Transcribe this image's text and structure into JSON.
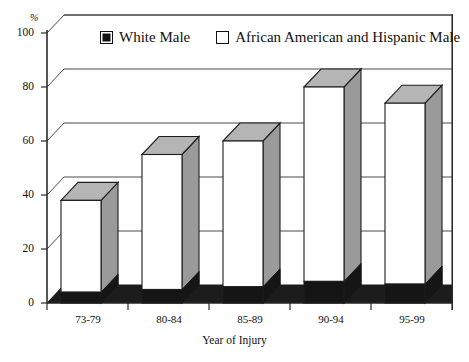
{
  "chart_data": {
    "type": "bar",
    "subtype": "stacked-3d-column",
    "title": "",
    "xlabel": "Year of Injury",
    "ylabel": "%",
    "ylim": [
      0,
      100
    ],
    "yticks": [
      0,
      20,
      40,
      60,
      80,
      100
    ],
    "grid": true,
    "legend_position": "top",
    "categories": [
      "73-79",
      "80-84",
      "85-89",
      "90-94",
      "95-99"
    ],
    "series": [
      {
        "name": "White Male",
        "color": "#151515",
        "values": [
          4,
          5,
          6,
          8,
          7
        ]
      },
      {
        "name": "African American and Hispanic Male",
        "color": "#ffffff",
        "values": [
          34,
          50,
          54,
          72,
          67
        ]
      }
    ],
    "totals": [
      38,
      55,
      60,
      80,
      74
    ]
  },
  "axes": {
    "y_unit": "%",
    "y_tick_labels": [
      "100",
      "80",
      "60",
      "40",
      "20",
      "0"
    ],
    "x_tick_labels": [
      "73-79",
      "80-84",
      "85-89",
      "90-94",
      "95-99"
    ],
    "x_axis_title": "Year of Injury"
  },
  "legend": {
    "items": [
      {
        "label": "White Male",
        "swatch": "filled-square-icon"
      },
      {
        "label": "African American and Hispanic Male",
        "swatch": "open-square-icon"
      }
    ]
  }
}
